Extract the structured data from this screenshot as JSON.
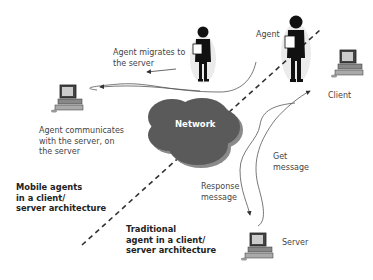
{
  "diagram": {
    "type": "network-architecture",
    "colors": {
      "background": "#ffffff",
      "network_cloud": "#5a5a5a",
      "network_cloud_shadow": "#8a8a8a",
      "line": "#555555",
      "dashed_divider": "#333333",
      "text": "#444444"
    },
    "nodes": {
      "network": {
        "label": "Network",
        "icon": "cloud-icon"
      },
      "client": {
        "label": "Client",
        "icon": "computer-icon"
      },
      "server": {
        "label": "Server",
        "icon": "computer-icon"
      },
      "remote_server": {
        "label": "",
        "icon": "computer-icon"
      },
      "agent_client": {
        "label": "Agent",
        "icon": "agent-figure-icon"
      },
      "agent_migrating": {
        "label": "",
        "icon": "agent-figure-icon"
      }
    },
    "edge_labels": {
      "agent_migrates": "Agent migrates to\nthe server",
      "agent_communicates": "Agent communicates\nwith the server, on\nthe server",
      "get_message": "Get\nmessage",
      "response_message": "Response\nmessage"
    },
    "region_labels": {
      "mobile": "Mobile agents\nin a client/\nserver architecture",
      "traditional": "Traditional\nagent in a client/\nserver architecture"
    }
  }
}
